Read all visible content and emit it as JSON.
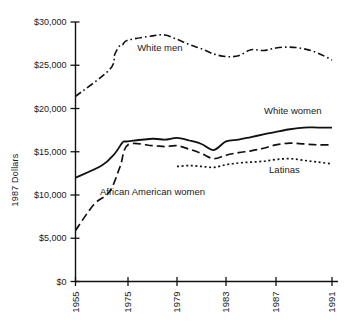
{
  "chart_data": {
    "type": "line",
    "title": "",
    "xlabel": "",
    "ylabel": "1987 Dollars",
    "ylim": [
      0,
      30000
    ],
    "grid": false,
    "legend_position": "inline-labels",
    "ytick_labels": [
      "$30,000",
      "$25,000",
      "$20,000",
      "$15,000",
      "$10,000",
      "$5,000",
      "$0"
    ],
    "ytick_values": [
      30000,
      25000,
      20000,
      15000,
      10000,
      5000,
      0
    ],
    "xtick_labels": [
      "1955",
      "1975",
      "1979",
      "1983",
      "1987",
      "1991"
    ],
    "xtick_values": [
      1955,
      1975,
      1979,
      1983,
      1987,
      1991
    ],
    "x": [
      1955,
      1975,
      1976,
      1977,
      1978,
      1979,
      1980,
      1981,
      1982,
      1983,
      1984,
      1985,
      1986,
      1987,
      1988,
      1989,
      1990,
      1991
    ],
    "series": [
      {
        "name": "White men",
        "style": "dash-dot",
        "color": "#111111",
        "label": "White men",
        "x": [
          1955,
          1968,
          1970,
          1972,
          1973,
          1975,
          1977,
          1978,
          1979,
          1980,
          1981,
          1982,
          1983,
          1984,
          1985,
          1986,
          1987,
          1988,
          1989,
          1990,
          1991
        ],
        "values": [
          21400,
          24500,
          26300,
          27300,
          27400,
          27900,
          28400,
          28500,
          28000,
          27400,
          26900,
          26300,
          26000,
          26100,
          26800,
          26700,
          27000,
          27100,
          26900,
          26400,
          25600
        ]
      },
      {
        "name": "White women",
        "style": "solid",
        "color": "#111111",
        "label": "White women",
        "x": [
          1955,
          1965,
          1970,
          1973,
          1975,
          1977,
          1978,
          1979,
          1980,
          1981,
          1982,
          1983,
          1984,
          1985,
          1986,
          1987,
          1988,
          1989,
          1990,
          1991
        ],
        "values": [
          12000,
          13400,
          14800,
          16100,
          16200,
          16500,
          16400,
          16600,
          16300,
          15900,
          15200,
          16200,
          16400,
          16700,
          17000,
          17300,
          17600,
          17800,
          17800,
          17800
        ]
      },
      {
        "name": "African American women",
        "style": "long-dash",
        "color": "#111111",
        "label": "African American women",
        "x": [
          1955,
          1962,
          1968,
          1972,
          1975,
          1977,
          1978,
          1979,
          1980,
          1981,
          1982,
          1983,
          1984,
          1985,
          1986,
          1987,
          1988,
          1989,
          1990,
          1991
        ],
        "values": [
          5900,
          8900,
          10400,
          13300,
          15800,
          15700,
          15600,
          15700,
          15300,
          14800,
          14200,
          14600,
          14900,
          15100,
          15400,
          15800,
          16000,
          15900,
          15800,
          15800
        ]
      },
      {
        "name": "Latinas",
        "style": "dotted",
        "color": "#111111",
        "label": "Latinas",
        "x": [
          1979,
          1980,
          1981,
          1982,
          1983,
          1984,
          1985,
          1986,
          1987,
          1988,
          1989,
          1990,
          1991
        ],
        "values": [
          13300,
          13400,
          13300,
          13200,
          13500,
          13700,
          13800,
          13900,
          14100,
          14200,
          14000,
          13800,
          13600
        ]
      }
    ]
  },
  "axis": {
    "y_axis_title": "1987 Dollars"
  }
}
